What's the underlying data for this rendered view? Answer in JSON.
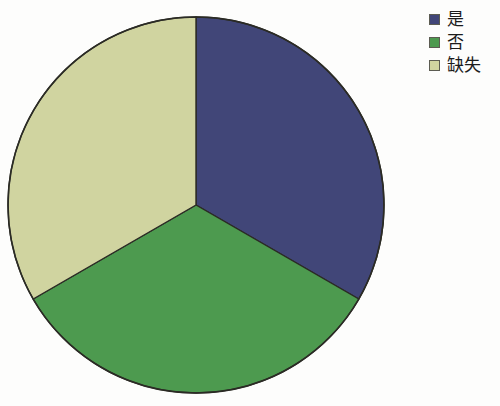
{
  "background_color": "#fdfdfc",
  "chart_data": {
    "type": "pie",
    "title": "",
    "categories": [
      "是",
      "否",
      "缺失"
    ],
    "values": [
      33.3,
      33.3,
      33.4
    ],
    "colors": [
      "#414678",
      "#4d9a4f",
      "#d0d4a0"
    ],
    "slice_border_color": "#2b2b25",
    "legend_position": "right",
    "start_angle_deg": 0,
    "direction": "clockwise",
    "grid": false,
    "xlabel": "",
    "ylabel": "",
    "annotations": []
  },
  "pie": {
    "center_x": 196,
    "center_y": 205,
    "radius": 188,
    "outline_color": "#2b2b25",
    "slices": [
      {
        "name": "slice-yes",
        "label": "是",
        "color": "#414678",
        "start_deg": 0,
        "end_deg": 120
      },
      {
        "name": "slice-no",
        "label": "否",
        "color": "#4d9a4f",
        "start_deg": 120,
        "end_deg": 240
      },
      {
        "name": "slice-missing",
        "label": "缺失",
        "color": "#d0d4a0",
        "start_deg": 240,
        "end_deg": 360
      }
    ]
  },
  "legend": {
    "items": [
      {
        "label": "是",
        "color": "#414678",
        "swatch_name": "legend-swatch-yes"
      },
      {
        "label": "否",
        "color": "#4d9a4f",
        "swatch_name": "legend-swatch-no"
      },
      {
        "label": "缺失",
        "color": "#d0d4a0",
        "swatch_name": "legend-swatch-missing"
      }
    ]
  }
}
